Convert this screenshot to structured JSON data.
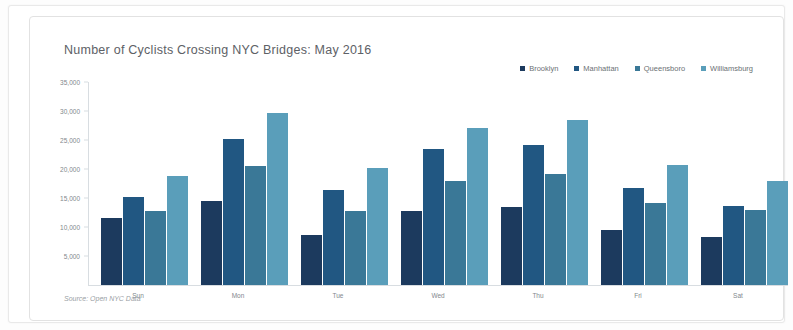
{
  "card": {
    "source_note": "Source: Open NYC Data"
  },
  "chart_data": {
    "type": "bar",
    "title": "Number of Cyclists Crossing NYC Bridges: May 2016",
    "xlabel": "",
    "ylabel": "",
    "categories": [
      "Sun",
      "Mon",
      "Tue",
      "Wed",
      "Thu",
      "Fri",
      "Sat"
    ],
    "series": [
      {
        "name": "Brooklyn",
        "color": "#1c3a5e",
        "values": [
          11500,
          14500,
          8600,
          12700,
          13500,
          9400,
          8300
        ]
      },
      {
        "name": "Manhattan",
        "color": "#215782",
        "values": [
          15100,
          25200,
          16300,
          23500,
          24200,
          16700,
          13700
        ]
      },
      {
        "name": "Queensboro",
        "color": "#3a7897",
        "values": [
          12700,
          20500,
          12800,
          18000,
          19200,
          14200,
          13000
        ]
      },
      {
        "name": "Williamsburg",
        "color": "#5a9eba",
        "values": [
          18800,
          29700,
          20100,
          27000,
          28500,
          20700,
          17900
        ]
      }
    ],
    "ylim": [
      0,
      35000
    ],
    "yticks": [
      5000,
      10000,
      15000,
      20000,
      25000,
      30000,
      35000
    ],
    "ytick_labels": [
      "5,000",
      "10,000",
      "15,000",
      "20,000",
      "25,000",
      "30,000",
      "35,000"
    ],
    "grid": false,
    "legend_position": "top-right"
  }
}
